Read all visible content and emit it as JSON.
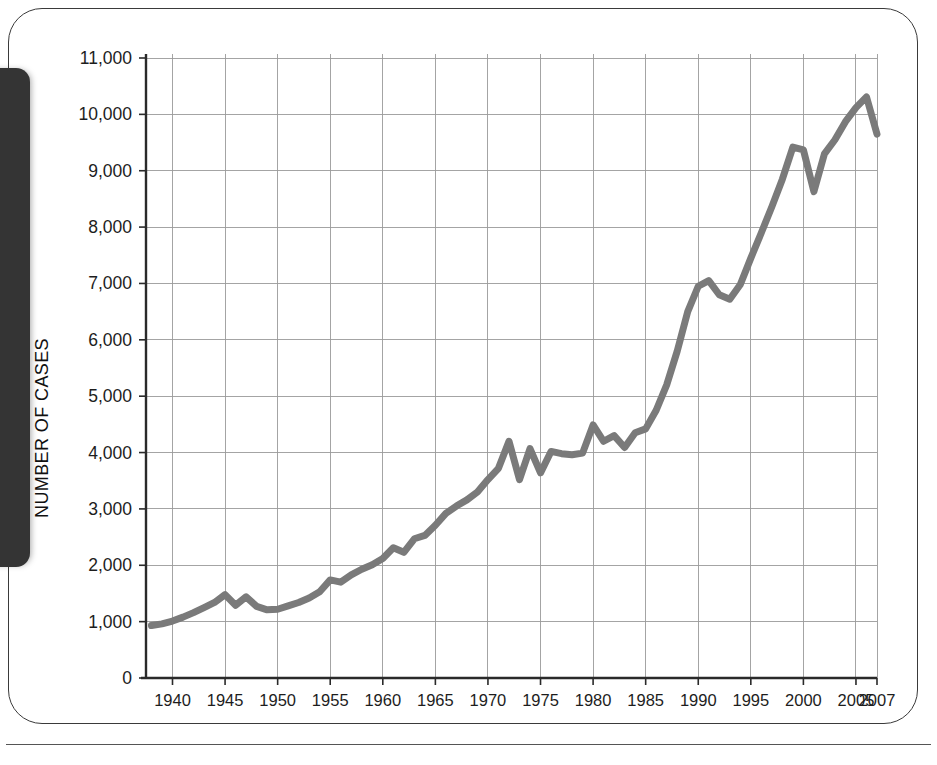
{
  "figure": {
    "frame": {
      "border_color": "#3a3a3a",
      "background": "#ffffff"
    },
    "side_tab": {
      "name": "chapter-tab",
      "color": "#343434"
    }
  },
  "chart_data": {
    "type": "line",
    "title": "",
    "subtitle": "",
    "xlabel": "",
    "ylabel": "NUMBER OF CASES",
    "xlim": [
      1938,
      2007
    ],
    "ylim": [
      0,
      11000
    ],
    "grid": true,
    "legend": null,
    "line_color": "#7a7a7a",
    "x_tick_labels": [
      "1940",
      "1945",
      "1950",
      "1955",
      "1960",
      "1965",
      "1970",
      "1975",
      "1980",
      "1985",
      "1990",
      "1995",
      "2000",
      "2005",
      "2007"
    ],
    "x_ticks": [
      1940,
      1945,
      1950,
      1955,
      1960,
      1965,
      1970,
      1975,
      1980,
      1985,
      1990,
      1995,
      2000,
      2005,
      2007
    ],
    "y_tick_labels": [
      "0",
      "1,000",
      "2,000",
      "3,000",
      "4,000",
      "5,000",
      "6,000",
      "7,000",
      "8,000",
      "9,000",
      "10,000",
      "11,000"
    ],
    "y_ticks": [
      0,
      1000,
      2000,
      3000,
      4000,
      5000,
      6000,
      7000,
      8000,
      9000,
      10000,
      11000
    ],
    "series": [
      {
        "name": "Number of cases",
        "x": [
          1938,
          1939,
          1940,
          1941,
          1942,
          1943,
          1944,
          1945,
          1946,
          1947,
          1948,
          1949,
          1950,
          1951,
          1952,
          1953,
          1954,
          1955,
          1956,
          1957,
          1958,
          1959,
          1960,
          1961,
          1962,
          1963,
          1964,
          1965,
          1966,
          1967,
          1968,
          1969,
          1970,
          1971,
          1972,
          1973,
          1974,
          1975,
          1976,
          1977,
          1978,
          1979,
          1980,
          1981,
          1982,
          1983,
          1984,
          1985,
          1986,
          1987,
          1988,
          1989,
          1990,
          1991,
          1992,
          1993,
          1994,
          1995,
          1996,
          1997,
          1998,
          1999,
          2000,
          2001,
          2002,
          2003,
          2004,
          2005,
          2006,
          2007
        ],
        "values": [
          930,
          960,
          1010,
          1080,
          1160,
          1250,
          1340,
          1480,
          1290,
          1440,
          1270,
          1210,
          1220,
          1280,
          1340,
          1420,
          1530,
          1740,
          1700,
          1830,
          1930,
          2010,
          2120,
          2310,
          2230,
          2470,
          2530,
          2710,
          2920,
          3050,
          3160,
          3300,
          3520,
          3720,
          4200,
          3520,
          4070,
          3640,
          4020,
          3980,
          3960,
          3990,
          4490,
          4200,
          4300,
          4090,
          4350,
          4420,
          4750,
          5200,
          5800,
          6500,
          6950,
          7050,
          6800,
          6720,
          6980,
          7450,
          7900,
          8360,
          8850,
          9420,
          9370,
          8630,
          9300,
          9550,
          9870,
          10120,
          10310,
          9650
        ]
      }
    ]
  }
}
